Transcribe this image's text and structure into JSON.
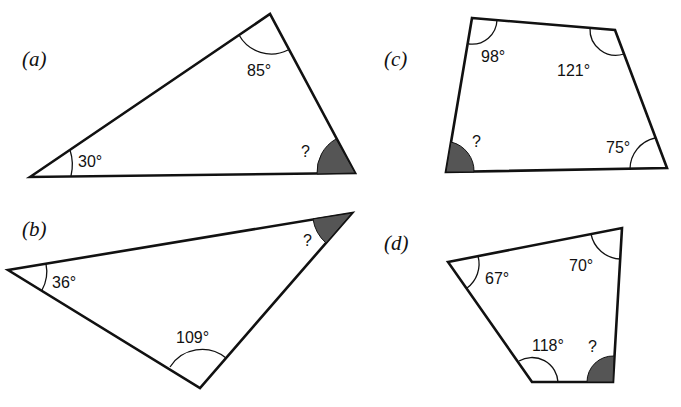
{
  "figures": [
    {
      "id": "a",
      "label": "(a)",
      "shape": "triangle",
      "angles": [
        {
          "value": "30°",
          "vertex": "bottom-left"
        },
        {
          "value": "85°",
          "vertex": "top"
        },
        {
          "value": "?",
          "vertex": "bottom-right",
          "unknown": true
        }
      ]
    },
    {
      "id": "b",
      "label": "(b)",
      "shape": "triangle",
      "angles": [
        {
          "value": "36°",
          "vertex": "left"
        },
        {
          "value": "109°",
          "vertex": "bottom"
        },
        {
          "value": "?",
          "vertex": "top-right",
          "unknown": true
        }
      ]
    },
    {
      "id": "c",
      "label": "(c)",
      "shape": "quadrilateral",
      "angles": [
        {
          "value": "98°",
          "vertex": "top-left"
        },
        {
          "value": "121°",
          "vertex": "top-right"
        },
        {
          "value": "75°",
          "vertex": "bottom-right"
        },
        {
          "value": "?",
          "vertex": "bottom-left",
          "unknown": true
        }
      ]
    },
    {
      "id": "d",
      "label": "(d)",
      "shape": "quadrilateral",
      "angles": [
        {
          "value": "67°",
          "vertex": "left"
        },
        {
          "value": "70°",
          "vertex": "top-right"
        },
        {
          "value": "118°",
          "vertex": "bottom-left"
        },
        {
          "value": "?",
          "vertex": "bottom-right",
          "unknown": true
        }
      ]
    }
  ],
  "colors": {
    "stroke": "#111111",
    "unknown_fill": "#555555",
    "background": "#ffffff"
  }
}
